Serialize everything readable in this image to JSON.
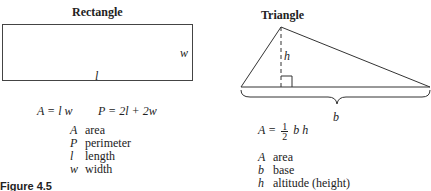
{
  "rectangle": {
    "title": "Rectangle",
    "side_label_width": "w",
    "side_label_length": "l",
    "formula_area": "A = l w",
    "formula_perimeter": "P = 2l + 2w",
    "legend": [
      {
        "symbol": "A",
        "meaning": "area"
      },
      {
        "symbol": "P",
        "meaning": "perimeter"
      },
      {
        "symbol": "l",
        "meaning": "length"
      },
      {
        "symbol": "w",
        "meaning": "width"
      }
    ]
  },
  "triangle": {
    "title": "Triangle",
    "height_label": "h",
    "base_label": "b",
    "formula_lhs": "A =",
    "formula_frac_num": "1",
    "formula_frac_den": "2",
    "formula_rhs": "b h",
    "legend": [
      {
        "symbol": "A",
        "meaning": "area"
      },
      {
        "symbol": "b",
        "meaning": "base"
      },
      {
        "symbol": "h",
        "meaning": "altitude (height)"
      }
    ]
  },
  "figure_label": "Figure 4.5"
}
